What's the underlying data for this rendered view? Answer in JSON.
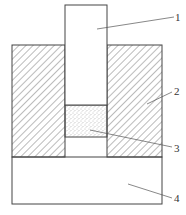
{
  "diagram": {
    "type": "cross-section schematic",
    "colors": {
      "stroke": "#444444",
      "hatch": "#555555",
      "fill": "#ffffff",
      "dots": "#777777"
    },
    "parts": [
      {
        "id": "1",
        "label": "1",
        "shape": "piston / upper plunger (plain rectangle)"
      },
      {
        "id": "2",
        "label": "2",
        "shape": "die walls (diagonal hatched blocks)"
      },
      {
        "id": "3",
        "label": "3",
        "shape": "powder/granular sample (stippled)"
      },
      {
        "id": "4",
        "label": "4",
        "shape": "base / lower punch (plain rectangle)"
      }
    ]
  }
}
